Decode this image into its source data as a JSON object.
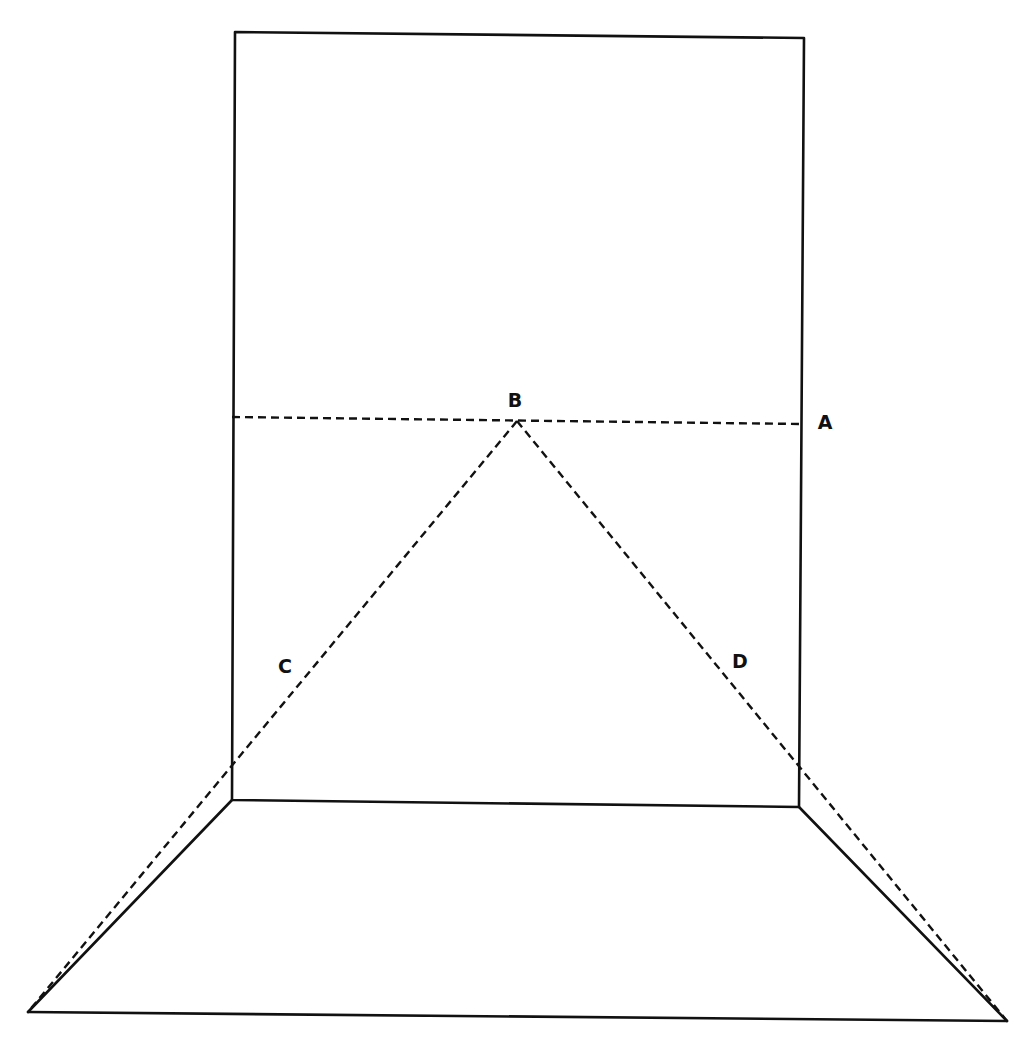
{
  "diagram": {
    "type": "geometric-line-drawing",
    "colors": {
      "background": "#ffffff",
      "stroke": "#111111"
    },
    "labels": [
      {
        "id": "B",
        "text": "B",
        "x": 515,
        "y": 400
      },
      {
        "id": "A",
        "text": "A",
        "x": 825,
        "y": 422
      },
      {
        "id": "C",
        "text": "C",
        "x": 285,
        "y": 666
      },
      {
        "id": "D",
        "text": "D",
        "x": 740,
        "y": 661
      }
    ],
    "points": {
      "rect_top_left": [
        235,
        32
      ],
      "rect_top_right": [
        804,
        38
      ],
      "rect_bottom_right": [
        799,
        807
      ],
      "rect_bottom_left": [
        232,
        800
      ],
      "floor_bottom_left": [
        28,
        1012
      ],
      "floor_bottom_right": [
        1007,
        1021
      ],
      "apex_B": [
        517,
        421
      ],
      "horizontal_left": [
        232,
        417
      ],
      "horizontal_right_A": [
        801,
        424
      ]
    },
    "lines": {
      "solid": [
        {
          "name": "rectangle",
          "points": "235,32 804,38 799,807 232,800 235,32"
        },
        {
          "name": "floor-left-edge",
          "points": "232,800 28,1012"
        },
        {
          "name": "floor-right-edge",
          "points": "799,807 1007,1021"
        },
        {
          "name": "floor-bottom-edge",
          "points": "28,1012 1007,1021"
        }
      ],
      "dashed": [
        {
          "name": "line-AB",
          "points": "232,417 801,424"
        },
        {
          "name": "line-BC",
          "points": "517,421 28,1012"
        },
        {
          "name": "line-BD",
          "points": "517,421 1007,1021"
        }
      ]
    }
  }
}
